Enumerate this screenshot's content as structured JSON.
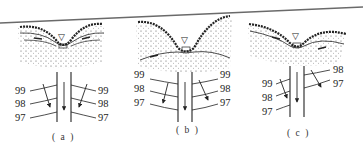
{
  "figure": {
    "colors": {
      "ink": "#222222",
      "page_edge": "#666666",
      "background": "#ffffff"
    },
    "panels": [
      {
        "id": "a",
        "caption": "( a )",
        "water_table_symbol": "▽",
        "left_labels": [
          "99",
          "98",
          "97"
        ],
        "right_labels": [
          "99",
          "98",
          "97"
        ]
      },
      {
        "id": "b",
        "caption": "( b )",
        "water_table_symbol": "▽",
        "left_labels": [
          "99",
          "98",
          "97"
        ],
        "right_labels": [
          "99",
          "98",
          "97"
        ]
      },
      {
        "id": "c",
        "caption": "( c )",
        "water_table_symbol": "▽",
        "left_labels": [
          "99",
          "98",
          "97"
        ],
        "right_labels": [
          "98",
          "97"
        ]
      }
    ]
  }
}
